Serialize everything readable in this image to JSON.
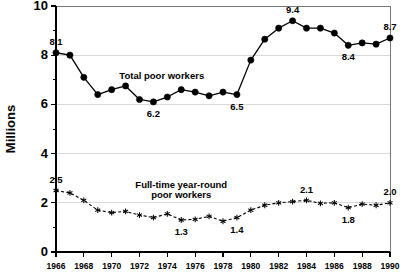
{
  "chart_data": {
    "type": "line",
    "title": "",
    "subtitle": "",
    "xlabel": "",
    "ylabel": "Millions",
    "xlim": [
      1966,
      1990
    ],
    "ylim": [
      0,
      10
    ],
    "grid": true,
    "grid_values": [
      2,
      4,
      6,
      8
    ],
    "legend_position": "inline-annotation",
    "x": [
      1966,
      1967,
      1968,
      1969,
      1970,
      1971,
      1972,
      1973,
      1974,
      1975,
      1976,
      1977,
      1978,
      1979,
      1980,
      1981,
      1982,
      1983,
      1984,
      1985,
      1986,
      1987,
      1988,
      1989,
      1990
    ],
    "x_tick_labels": [
      "1966",
      "1968",
      "1970",
      "1972",
      "1974",
      "1976",
      "1978",
      "1980",
      "1982",
      "1984",
      "1986",
      "1988",
      "1990"
    ],
    "x_tick_values": [
      1966,
      1968,
      1970,
      1972,
      1974,
      1976,
      1978,
      1980,
      1982,
      1984,
      1986,
      1988,
      1990
    ],
    "y_tick_labels": [
      "0",
      "2",
      "4",
      "6",
      "8",
      "10"
    ],
    "y_tick_values": [
      0,
      2,
      4,
      6,
      8,
      10
    ],
    "y_minor_tick_values": [
      1,
      3,
      5,
      7,
      9
    ],
    "series": [
      {
        "name": "Total poor workers",
        "marker": "filled-circle",
        "linestyle": "solid",
        "color": "#000000",
        "label_x": 1973.6,
        "label_y": 7.05,
        "values": [
          8.1,
          8.0,
          7.1,
          6.4,
          6.6,
          6.75,
          6.2,
          6.1,
          6.3,
          6.6,
          6.5,
          6.35,
          6.5,
          6.4,
          7.8,
          8.65,
          9.1,
          9.4,
          9.1,
          9.1,
          8.9,
          8.4,
          8.5,
          8.45,
          8.7
        ],
        "annotations": [
          {
            "x": 1966,
            "value": "8.1",
            "placement": "above"
          },
          {
            "x": 1973,
            "value": "6.2",
            "placement": "below"
          },
          {
            "x": 1979,
            "value": "6.5",
            "placement": "below"
          },
          {
            "x": 1983,
            "value": "9.4",
            "placement": "above"
          },
          {
            "x": 1987,
            "value": "8.4",
            "placement": "below"
          },
          {
            "x": 1990,
            "value": "8.7",
            "placement": "above"
          }
        ]
      },
      {
        "name": "Full-time year-round poor workers",
        "marker": "asterisk",
        "linestyle": "dashed",
        "color": "#000000",
        "label_line1": "Full-time year-round",
        "label_line2": "poor workers",
        "label_x": 1975.0,
        "label_y": 2.62,
        "values": [
          2.5,
          2.4,
          2.1,
          1.7,
          1.6,
          1.65,
          1.5,
          1.4,
          1.55,
          1.3,
          1.33,
          1.45,
          1.25,
          1.4,
          1.7,
          1.9,
          2.0,
          2.05,
          2.1,
          1.98,
          2.0,
          1.8,
          1.95,
          1.9,
          2.0
        ],
        "annotations": [
          {
            "x": 1966,
            "value": "2.5",
            "placement": "above"
          },
          {
            "x": 1975,
            "value": "1.3",
            "placement": "below"
          },
          {
            "x": 1979,
            "value": "1.4",
            "placement": "below"
          },
          {
            "x": 1984,
            "value": "2.1",
            "placement": "above"
          },
          {
            "x": 1987,
            "value": "1.8",
            "placement": "below"
          },
          {
            "x": 1990,
            "value": "2.0",
            "placement": "above"
          }
        ]
      }
    ]
  }
}
